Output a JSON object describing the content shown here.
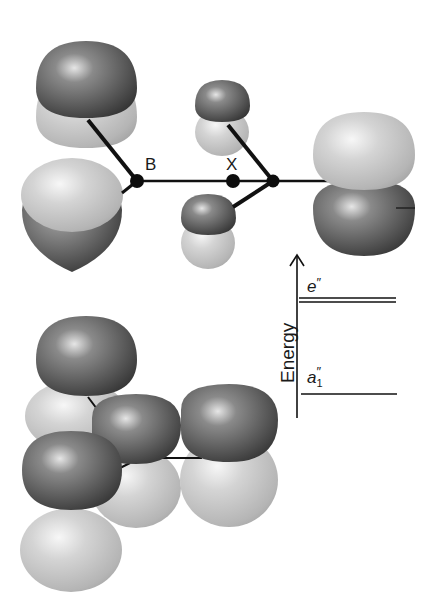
{
  "diagram": {
    "type": "molecular-orbital-illustration",
    "atoms": {
      "boron_label": "B",
      "center_label": "X"
    },
    "energy_diagram": {
      "axis_label": "Energy",
      "levels": [
        {
          "symbol": "e",
          "superscript": "″",
          "subscript": "",
          "degenerate": true
        },
        {
          "symbol": "a",
          "superscript": "″",
          "subscript": "1",
          "degenerate": false
        }
      ]
    },
    "colors": {
      "dark_lobe": "#5a5a5a",
      "light_lobe": "#c8c8c8",
      "bond": "#111111",
      "background": "#ffffff"
    }
  }
}
